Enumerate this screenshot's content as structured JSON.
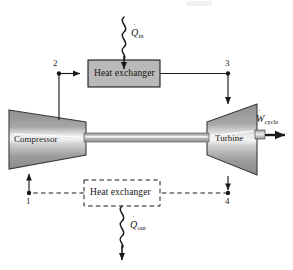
{
  "figure": {
    "type": "thermodynamic-cycle-schematic",
    "name": "Brayton cycle gas turbine power plant schematic",
    "background_color": "#ffffff",
    "line_color": "#1a1a1a",
    "device_fill_dark": "#8a8a8a",
    "device_fill_light": "#d9d9d9",
    "box_fill": "#b9b9b9",
    "box_border": "#1a1a1a"
  },
  "components": {
    "heat_exchanger_in": {
      "label": "Heat exchanger",
      "style": "solid-filled"
    },
    "heat_exchanger_out": {
      "label": "Heat exchanger",
      "style": "dashed-outline"
    },
    "compressor": {
      "label": "Compressor"
    },
    "turbine": {
      "label": "Turbine"
    },
    "shaft": {
      "label": "shaft"
    }
  },
  "energy_flows": {
    "heat_in": {
      "symbol": "Q",
      "dot": "˙",
      "subscript": "in",
      "direction": "into-heat-exchanger-downward"
    },
    "heat_out": {
      "symbol": "Q",
      "dot": "˙",
      "subscript": "out",
      "direction": "out-of-heat-exchanger-downward"
    },
    "work_cycle": {
      "symbol": "W",
      "dot": "˙",
      "subscript": "cycle",
      "direction": "out-of-turbine-rightward"
    }
  },
  "states": [
    {
      "id": "1",
      "label": "1"
    },
    {
      "id": "2",
      "label": "2"
    },
    {
      "id": "3",
      "label": "3"
    },
    {
      "id": "4",
      "label": "4"
    }
  ]
}
